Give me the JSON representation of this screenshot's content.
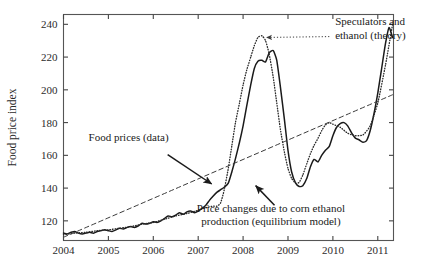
{
  "chart_data": {
    "type": "line",
    "title": "",
    "xlabel": "",
    "ylabel": "Food price index",
    "xlim": [
      2004.0,
      2011.35
    ],
    "ylim": [
      108,
      246
    ],
    "grid": false,
    "legend_position": "none",
    "xticks": [
      "2004",
      "2005",
      "2006",
      "2007",
      "2008",
      "2009",
      "2010",
      "2011"
    ],
    "xtick_values": [
      2004,
      2005,
      2006,
      2007,
      2008,
      2009,
      2010,
      2011
    ],
    "yticks": [
      "120",
      "140",
      "160",
      "180",
      "200",
      "220",
      "240"
    ],
    "ytick_values": [
      120,
      140,
      160,
      180,
      200,
      220,
      240
    ],
    "series": [
      {
        "name": "Food prices (data)",
        "style": "solid",
        "color": "#1a1a1a",
        "x": [
          2004.0,
          2004.08,
          2004.17,
          2004.25,
          2004.33,
          2004.42,
          2004.5,
          2004.58,
          2004.67,
          2004.75,
          2004.83,
          2004.92,
          2005.0,
          2005.08,
          2005.17,
          2005.25,
          2005.33,
          2005.42,
          2005.5,
          2005.58,
          2005.67,
          2005.75,
          2005.83,
          2005.92,
          2006.0,
          2006.08,
          2006.17,
          2006.25,
          2006.33,
          2006.42,
          2006.5,
          2006.58,
          2006.67,
          2006.75,
          2006.83,
          2006.92,
          2007.0,
          2007.08,
          2007.17,
          2007.25,
          2007.33,
          2007.42,
          2007.5,
          2007.58,
          2007.67,
          2007.75,
          2007.83,
          2007.92,
          2008.0,
          2008.08,
          2008.17,
          2008.25,
          2008.33,
          2008.42,
          2008.5,
          2008.58,
          2008.67,
          2008.75,
          2008.83,
          2008.92,
          2009.0,
          2009.08,
          2009.17,
          2009.25,
          2009.33,
          2009.42,
          2009.5,
          2009.58,
          2009.67,
          2009.75,
          2009.83,
          2009.92,
          2010.0,
          2010.08,
          2010.17,
          2010.25,
          2010.33,
          2010.42,
          2010.5,
          2010.58,
          2010.67,
          2010.75,
          2010.83,
          2010.92,
          2011.0,
          2011.08,
          2011.17,
          2011.25,
          2011.33
        ],
        "y": [
          112.5,
          112.0,
          113.0,
          113.5,
          112.5,
          112.0,
          112.5,
          113.0,
          112.5,
          113.5,
          114.0,
          114.5,
          114.0,
          113.5,
          114.5,
          115.5,
          115.0,
          116.0,
          116.5,
          116.0,
          117.0,
          118.5,
          118.0,
          118.5,
          119.5,
          119.0,
          120.0,
          121.5,
          123.0,
          122.5,
          123.5,
          125.0,
          124.0,
          125.5,
          126.0,
          125.0,
          126.0,
          127.5,
          129.5,
          132.5,
          135.0,
          137.5,
          139.0,
          140.5,
          143.0,
          150.0,
          158.0,
          168.0,
          178.0,
          190.0,
          203.0,
          213.0,
          217.5,
          218.0,
          217.0,
          222.5,
          224.0,
          218.0,
          202.0,
          182.0,
          163.0,
          150.0,
          143.0,
          141.0,
          141.5,
          146.0,
          153.0,
          157.5,
          156.0,
          160.0,
          163.0,
          165.5,
          172.0,
          177.0,
          179.5,
          180.0,
          178.0,
          173.5,
          170.5,
          169.5,
          168.0,
          169.0,
          175.0,
          186.0,
          198.0,
          212.0,
          228.0,
          238.0,
          232.0
        ]
      },
      {
        "name": "Speculators and ethanol (theory)",
        "style": "dotted",
        "color": "#2b2b2b",
        "x": [
          2004.0,
          2004.25,
          2004.5,
          2004.75,
          2005.0,
          2005.25,
          2005.5,
          2005.75,
          2006.0,
          2006.25,
          2006.5,
          2006.75,
          2007.0,
          2007.17,
          2007.33,
          2007.42,
          2007.5,
          2007.58,
          2007.67,
          2007.75,
          2007.83,
          2007.92,
          2008.0,
          2008.08,
          2008.17,
          2008.25,
          2008.33,
          2008.42,
          2008.5,
          2008.58,
          2008.67,
          2008.75,
          2008.83,
          2008.92,
          2009.0,
          2009.08,
          2009.17,
          2009.25,
          2009.33,
          2009.42,
          2009.5,
          2009.58,
          2009.67,
          2009.75,
          2009.83,
          2009.92,
          2010.0,
          2010.17,
          2010.33,
          2010.5,
          2010.67,
          2010.83,
          2011.0,
          2011.17,
          2011.33
        ],
        "y": [
          111.5,
          112.5,
          113.0,
          114.0,
          114.5,
          115.5,
          116.5,
          118.0,
          119.0,
          121.0,
          123.0,
          124.5,
          126.5,
          128.0,
          129.0,
          129.0,
          131.0,
          139.0,
          152.0,
          166.0,
          180.0,
          192.0,
          203.0,
          212.0,
          220.0,
          227.0,
          232.0,
          233.0,
          230.0,
          222.0,
          208.0,
          192.0,
          176.0,
          162.0,
          152.0,
          146.0,
          143.0,
          143.5,
          148.0,
          155.0,
          161.0,
          166.0,
          170.5,
          175.0,
          178.5,
          180.0,
          179.0,
          177.0,
          173.5,
          172.0,
          172.5,
          178.0,
          192.0,
          215.0,
          240.0
        ]
      },
      {
        "name": "Price changes due to corn ethanol production (equilibrium model)",
        "style": "dashed",
        "color": "#3a3a3a",
        "x": [
          2004.0,
          2011.33
        ],
        "y": [
          110.0,
          197.0
        ]
      }
    ],
    "annotations": [
      {
        "name": "speculators-ethanol-theory",
        "text_lines": [
          "Speculators and",
          "ethanol (theory)"
        ],
        "text_x": 2010.05,
        "text_y": 239.5,
        "arrow_from_x": 2009.92,
        "arrow_from_y": 232.5,
        "arrow_to_x": 2008.52,
        "arrow_to_y": 232.0,
        "arrow_style": "dotted"
      },
      {
        "name": "food-prices-data",
        "text_lines": [
          "Food prices (data)"
        ],
        "text_x": 2005.45,
        "text_y": 168.5,
        "arrow_from_x": 2006.32,
        "arrow_from_y": 160.5,
        "arrow_to_x": 2007.3,
        "arrow_to_y": 142.5,
        "arrow_style": "solid"
      },
      {
        "name": "corn-ethanol-equilibrium-model",
        "text_lines": [
          "Price changes due to corn ethanol",
          "production (equilibrium model)"
        ],
        "text_x": 2008.62,
        "text_y": 125.5,
        "arrow_from_x": 2008.7,
        "arrow_from_y": 129.5,
        "arrow_to_x": 2008.28,
        "arrow_to_y": 141.5,
        "arrow_style": "solid"
      }
    ]
  }
}
